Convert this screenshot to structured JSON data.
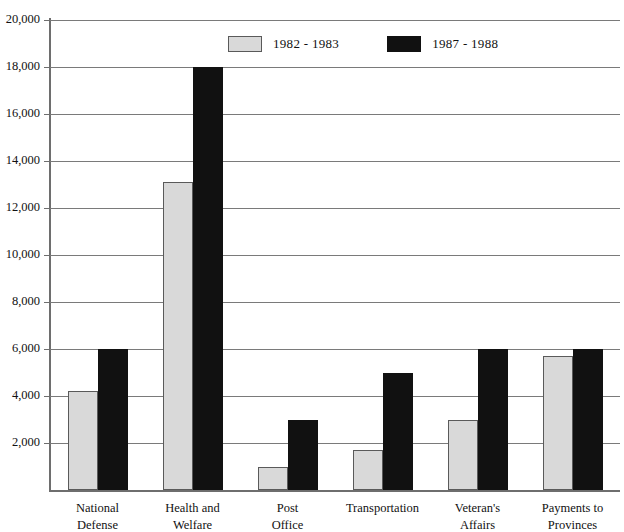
{
  "chart_data": {
    "type": "bar",
    "title": "",
    "xlabel": "",
    "ylabel": "",
    "ylim": [
      0,
      20000
    ],
    "grid": true,
    "legend_position": "top-center",
    "categories": [
      "National Defense",
      "Health and Welfare",
      "Post Office",
      "Transportation",
      "Veteran's Affairs",
      "Payments to Provinces"
    ],
    "category_lines": [
      [
        "National",
        "Defense"
      ],
      [
        "Health and",
        "Welfare"
      ],
      [
        "Post",
        "Office"
      ],
      [
        "Transportation",
        ""
      ],
      [
        "Veteran's",
        "Affairs"
      ],
      [
        "Payments to",
        "Provinces"
      ]
    ],
    "series": [
      {
        "name": "1982 - 1983",
        "color": "#d9d9d9",
        "values": [
          4200,
          13100,
          1000,
          1700,
          3000,
          5700
        ]
      },
      {
        "name": "1987 - 1988",
        "color": "#111111",
        "values": [
          6000,
          18000,
          3000,
          5000,
          6000,
          6000
        ]
      }
    ],
    "ytick_values": [
      2000,
      4000,
      6000,
      8000,
      10000,
      12000,
      14000,
      16000,
      18000,
      20000
    ],
    "ytick_labels": [
      "2,000",
      "4,000",
      "6,000",
      "8,000",
      "10,000",
      "12,000",
      "14,000",
      "16,000",
      "18,000",
      "20,000"
    ]
  },
  "legend": {
    "items": [
      {
        "label": "1982 - 1983"
      },
      {
        "label": "1987 - 1988"
      }
    ]
  }
}
